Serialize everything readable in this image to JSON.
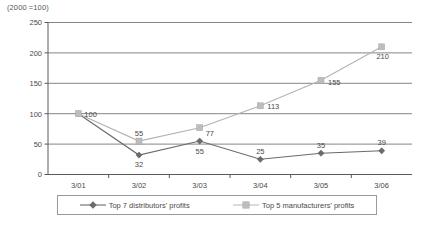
{
  "unit_note": "(2000 =100)",
  "legend": {
    "entries": [
      {
        "label": "Top 7 distributors' profits",
        "marker": "diamond-marker-icon",
        "color": "#6b6b6b"
      },
      {
        "label": "Top 5 manufacturers' profits",
        "marker": "square-marker-icon",
        "color": "#bdbdbd"
      }
    ]
  },
  "chart_data": {
    "type": "line",
    "title": "",
    "subtitle": "",
    "xlabel": "",
    "ylabel": "",
    "note": "(2000 =100)",
    "categories": [
      "3/01",
      "3/02",
      "3/03",
      "3/04",
      "3/05",
      "3/06"
    ],
    "yticks": [
      0,
      50,
      100,
      150,
      200,
      250
    ],
    "ylim": [
      0,
      250
    ],
    "grid": true,
    "legend_position": "bottom",
    "series": [
      {
        "name": "Top 7 distributors' profits",
        "color": "#6b6b6b",
        "marker": "diamond",
        "values": [
          100,
          32,
          55,
          25,
          35,
          39
        ],
        "point_labels": [
          "100",
          "32",
          "55",
          "25",
          "35",
          "39"
        ]
      },
      {
        "name": "Top 5 manufacturers' profits",
        "color": "#bdbdbd",
        "marker": "square",
        "values": [
          100,
          55,
          77,
          113,
          155,
          210
        ],
        "point_labels": [
          "100",
          "55",
          "77",
          "113",
          "155",
          "210"
        ]
      }
    ]
  }
}
